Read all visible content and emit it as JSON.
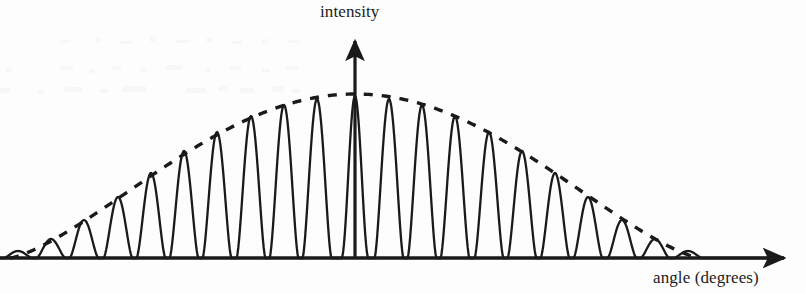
{
  "figure": {
    "title": "",
    "ylabel": "intensity",
    "xlabel": "angle (degrees)",
    "ink_color": "#1a1a1a",
    "background_color": "#fdfdfd"
  },
  "chart_data": {
    "type": "line",
    "title": "",
    "xlabel": "angle (degrees)",
    "ylabel": "intensity",
    "xlim": [
      -11,
      11
    ],
    "ylim": [
      0,
      1.08
    ],
    "grid": false,
    "legend": false,
    "axis_style": {
      "x_axis": "arrow-right",
      "y_axis": "arrow-up",
      "x_axis_y_px": 258,
      "y_axis_x_px": 355,
      "x_axis_arrow_tip_px": 791,
      "y_axis_arrow_tip_px": 33,
      "ticks": false,
      "tick_labels": false
    },
    "series": [
      {
        "name": "interference pattern",
        "style": "solid",
        "linewidth": 2.2,
        "peak_order": [
          -10,
          -9,
          -8,
          -7,
          -6,
          -5,
          -4,
          -3,
          -2,
          -1,
          0,
          1,
          2,
          3,
          4,
          5,
          6,
          7,
          8,
          9,
          10
        ],
        "peak_x_px": [
          18,
          51,
          84,
          118,
          151,
          184,
          217,
          251,
          284,
          317,
          355,
          389,
          422,
          455,
          489,
          522,
          555,
          588,
          622,
          655,
          688
        ],
        "peak_intensity": [
          0.04,
          0.12,
          0.24,
          0.38,
          0.53,
          0.67,
          0.79,
          0.89,
          0.96,
          0.99,
          1.0,
          0.99,
          0.96,
          0.89,
          0.79,
          0.67,
          0.53,
          0.38,
          0.24,
          0.12,
          0.04
        ],
        "peak_height_px": [
          251,
          239,
          220,
          197,
          173,
          151,
          132,
          116,
          105,
          99,
          96,
          99,
          105,
          116,
          132,
          151,
          173,
          197,
          220,
          239,
          251
        ],
        "peak_spacing_px": 33.5,
        "central_peak_taller": true
      },
      {
        "name": "diffraction envelope",
        "style": "dashed",
        "linewidth": 3.4,
        "dash_px": [
          9,
          9
        ],
        "envelope_shape": "arc",
        "envelope_start_x_px": 10,
        "envelope_end_x_px": 700,
        "envelope_peak_x_px": 355,
        "envelope_peak_y_px": 94,
        "envelope_baseline_y_px": 258
      }
    ]
  }
}
